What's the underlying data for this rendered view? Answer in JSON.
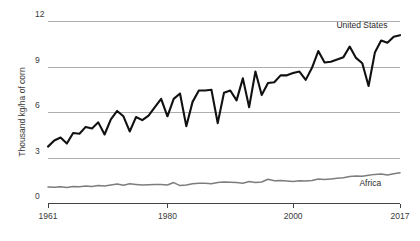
{
  "chart_data": {
    "type": "line",
    "title": "",
    "subtitle": "",
    "xlabel": "",
    "ylabel": "Thousand kg/ha of corn",
    "xlim": [
      1961,
      2017
    ],
    "ylim": [
      0,
      12
    ],
    "grid": true,
    "gridlines_y": [
      0,
      3,
      6,
      9,
      12
    ],
    "ytick_labels": [
      "0",
      "3",
      "6",
      "9",
      "12"
    ],
    "ytick_values": [
      0,
      3,
      6,
      9,
      12
    ],
    "xtick_labels": [
      "1961",
      "1980",
      "2000",
      "2017"
    ],
    "xtick_values": [
      1961,
      1980,
      2000,
      2017
    ],
    "legend_position": "inline-end-of-line",
    "x": [
      1961,
      1962,
      1963,
      1964,
      1965,
      1966,
      1967,
      1968,
      1969,
      1970,
      1971,
      1972,
      1973,
      1974,
      1975,
      1976,
      1977,
      1978,
      1979,
      1980,
      1981,
      1982,
      1983,
      1984,
      1985,
      1986,
      1987,
      1988,
      1989,
      1990,
      1991,
      1992,
      1993,
      1994,
      1995,
      1996,
      1997,
      1998,
      1999,
      2000,
      2001,
      2002,
      2003,
      2004,
      2005,
      2006,
      2007,
      2008,
      2009,
      2010,
      2011,
      2012,
      2013,
      2014,
      2015,
      2016,
      2017
    ],
    "series": [
      {
        "name": "United States",
        "color": "#111111",
        "label_x": 2015,
        "label_y": 11.55,
        "values": [
          3.75,
          4.15,
          4.35,
          3.95,
          4.65,
          4.6,
          5.05,
          4.95,
          5.35,
          4.55,
          5.55,
          6.1,
          5.75,
          4.75,
          5.7,
          5.5,
          5.8,
          6.35,
          6.9,
          5.75,
          6.9,
          7.25,
          5.1,
          6.7,
          7.45,
          7.45,
          7.5,
          5.3,
          7.3,
          7.45,
          6.8,
          8.25,
          6.35,
          8.7,
          7.15,
          7.95,
          8.0,
          8.45,
          8.45,
          8.6,
          8.7,
          8.15,
          8.95,
          10.05,
          9.3,
          9.35,
          9.5,
          9.65,
          10.35,
          9.6,
          9.25,
          7.75,
          9.95,
          10.75,
          10.6,
          11.0,
          11.1
        ]
      },
      {
        "name": "Africa",
        "color": "#7d7d7d",
        "label_x": 2014,
        "label_y": 1.18,
        "values": [
          1.08,
          1.07,
          1.1,
          1.05,
          1.12,
          1.1,
          1.16,
          1.12,
          1.18,
          1.15,
          1.22,
          1.28,
          1.2,
          1.3,
          1.26,
          1.22,
          1.24,
          1.26,
          1.25,
          1.22,
          1.38,
          1.18,
          1.22,
          1.3,
          1.34,
          1.33,
          1.3,
          1.38,
          1.42,
          1.4,
          1.38,
          1.34,
          1.45,
          1.38,
          1.42,
          1.6,
          1.5,
          1.52,
          1.48,
          1.45,
          1.5,
          1.48,
          1.52,
          1.62,
          1.58,
          1.62,
          1.66,
          1.7,
          1.78,
          1.82,
          1.8,
          1.86,
          1.92,
          1.95,
          1.88,
          1.96,
          2.02
        ]
      }
    ]
  }
}
